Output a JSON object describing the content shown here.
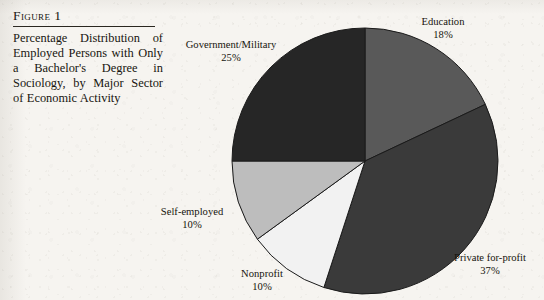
{
  "figure": {
    "label": "Figure 1",
    "caption": "Percentage Distribution of Employed Persons with Only a Bachelor's Degree in Sociology, by Major Sector of Economic Activity"
  },
  "labels": {
    "education": {
      "name": "Education",
      "pct": "18%"
    },
    "private": {
      "name": "Private for-profit",
      "pct": "37%"
    },
    "nonprofit": {
      "name": "Nonprofit",
      "pct": "10%"
    },
    "selfemployed": {
      "name": "Self-employed",
      "pct": "10%"
    },
    "government": {
      "name": "Government/Military",
      "pct": "25%"
    }
  },
  "chart_data": {
    "type": "pie",
    "title": "Percentage Distribution of Employed Persons with Only a Bachelor's Degree in Sociology, by Major Sector of Economic Activity",
    "categories": [
      "Education",
      "Private for-profit",
      "Nonprofit",
      "Self-employed",
      "Government/Military"
    ],
    "values": [
      18,
      37,
      10,
      10,
      25
    ],
    "unit": "percent",
    "total": 100,
    "start_angle_deg": 0,
    "direction": "clockwise",
    "legend": "none",
    "labels_position": "outside",
    "colors": [
      "#595959",
      "#3a3a3a",
      "#f2f2f2",
      "#bdbdbd",
      "#262626"
    ],
    "slice_outline": "#1a1a1a",
    "geometry": {
      "cx": 365,
      "cy": 161,
      "r": 133
    },
    "background": "#f6f4f0"
  }
}
